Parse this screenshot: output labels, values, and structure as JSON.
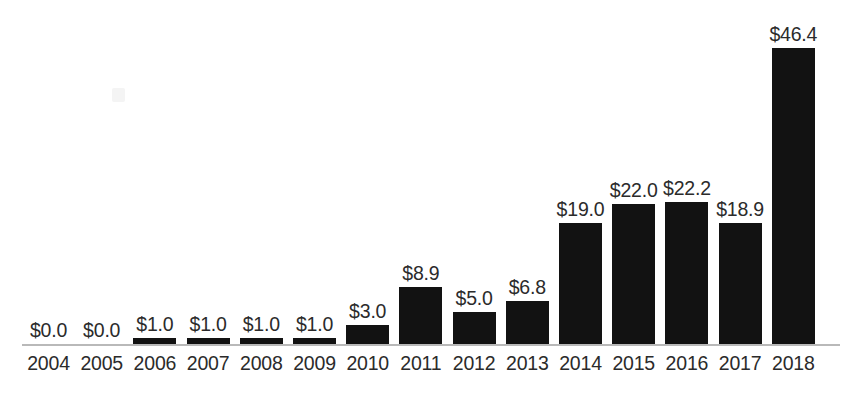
{
  "chart_data": {
    "type": "bar",
    "title": "",
    "subtitle": "",
    "xlabel": "",
    "ylabel": "",
    "categories": [
      "2004",
      "2005",
      "2006",
      "2007",
      "2008",
      "2009",
      "2010",
      "2011",
      "2012",
      "2013",
      "2014",
      "2015",
      "2016",
      "2017",
      "2018"
    ],
    "values": [
      0.0,
      0.0,
      1.0,
      1.0,
      1.0,
      1.0,
      3.0,
      8.9,
      5.0,
      6.8,
      19.0,
      22.0,
      22.2,
      18.9,
      46.4
    ],
    "data_labels": [
      "$0.0",
      "$0.0",
      "$1.0",
      "$1.0",
      "$1.0",
      "$1.0",
      "$3.0",
      "$8.9",
      "$5.0",
      "$6.8",
      "$19.0",
      "$22.0",
      "$22.2",
      "$18.9",
      "$46.4"
    ],
    "value_prefix": "$",
    "ylim": [
      0,
      46.4
    ],
    "grid": false,
    "legend": null,
    "legend_position": "none",
    "annotations": [],
    "series": [
      {
        "name": "",
        "values": [
          0.0,
          0.0,
          1.0,
          1.0,
          1.0,
          1.0,
          3.0,
          8.9,
          5.0,
          6.8,
          19.0,
          22.0,
          22.2,
          18.9,
          46.4
        ]
      }
    ]
  },
  "style": {
    "bar_color": "#121212",
    "axis_color": "#b9b9b9",
    "text_color": "#2b2b2b",
    "background": "#ffffff"
  }
}
